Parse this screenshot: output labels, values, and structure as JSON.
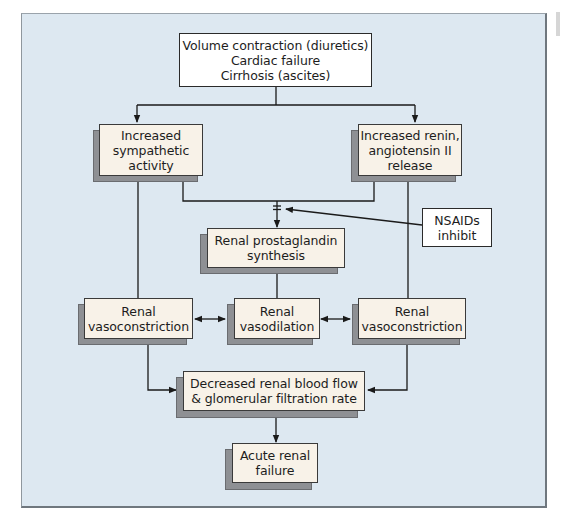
{
  "diagram": {
    "type": "flowchart",
    "colors": {
      "panel_background": "#dde8f1",
      "box_face": "#f8f2e8",
      "box_shadow": "#8e9094",
      "plain_box": "#ffffff",
      "line": "#1a1a1a"
    },
    "nodes": {
      "causes": {
        "label": "Volume contraction (diuretics)\nCardiac failure\nCirrhosis (ascites)"
      },
      "sympathetic": {
        "label": "Increased\nsympathetic\nactivity"
      },
      "renin": {
        "label": "Increased renin,\nangiotensin II\nrelease"
      },
      "nsaids": {
        "label": "NSAIDs\ninhibit"
      },
      "prostaglandin": {
        "label": "Renal prostaglandin\nsynthesis"
      },
      "vasoconstriction_left": {
        "label": "Renal\nvasoconstriction"
      },
      "vasodilation": {
        "label": "Renal\nvasodilation"
      },
      "vasoconstriction_right": {
        "label": "Renal\nvasoconstriction"
      },
      "decreased_flow": {
        "label": "Decreased renal blood flow\n& glomerular filtration rate"
      },
      "acute_failure": {
        "label": "Acute renal\nfailure"
      }
    },
    "edges": [
      {
        "from": "causes",
        "to": "sympathetic",
        "type": "arrow"
      },
      {
        "from": "causes",
        "to": "renin",
        "type": "arrow"
      },
      {
        "from": "sympathetic",
        "to": "prostaglandin",
        "type": "arrow"
      },
      {
        "from": "renin",
        "to": "prostaglandin",
        "type": "arrow"
      },
      {
        "from": "nsaids",
        "to": "prostaglandin",
        "type": "inhibit"
      },
      {
        "from": "sympathetic",
        "to": "vasoconstriction_left",
        "type": "line"
      },
      {
        "from": "prostaglandin",
        "to": "vasodilation",
        "type": "line"
      },
      {
        "from": "renin",
        "to": "vasoconstriction_right",
        "type": "line"
      },
      {
        "from": "vasoconstriction_left",
        "to": "vasodilation",
        "type": "bidirectional"
      },
      {
        "from": "vasodilation",
        "to": "vasoconstriction_right",
        "type": "bidirectional"
      },
      {
        "from": "vasoconstriction_left",
        "to": "decreased_flow",
        "type": "arrow"
      },
      {
        "from": "vasoconstriction_right",
        "to": "decreased_flow",
        "type": "arrow"
      },
      {
        "from": "decreased_flow",
        "to": "acute_failure",
        "type": "arrow"
      }
    ]
  }
}
